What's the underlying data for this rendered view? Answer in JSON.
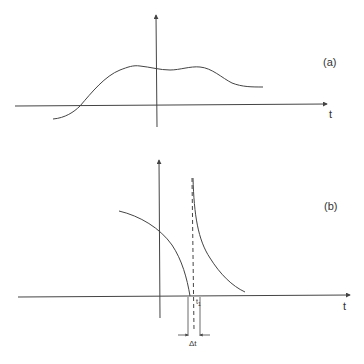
{
  "panels": [
    {
      "id": "a",
      "label": "(a)",
      "axis_label": "t",
      "description": "Smooth continuous function with two broad maxima"
    },
    {
      "id": "b",
      "label": "(b)",
      "axis_label": "t",
      "description": "Function with a singularity at t1; divergent on both sides",
      "singularity_label": "t",
      "singularity_subscript": "1",
      "interval_label": "Δt"
    }
  ],
  "colors": {
    "stroke": "#444444",
    "background": "#ffffff"
  }
}
